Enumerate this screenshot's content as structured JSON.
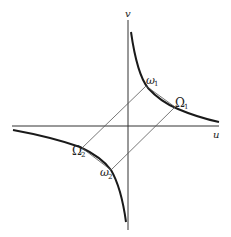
{
  "diagram": {
    "axes": {
      "x_label": "u",
      "y_label": "v"
    },
    "points": {
      "omega1": {
        "label": "ω",
        "sub": "1"
      },
      "Omega1": {
        "label": "Ω",
        "sub": "1"
      },
      "omega2": {
        "label": "ω",
        "sub": "2"
      },
      "Omega2": {
        "label": "Ω",
        "sub": "2"
      }
    },
    "colors": {
      "curve": "#1a1a1a",
      "axis": "#333333",
      "line": "#555555"
    }
  }
}
